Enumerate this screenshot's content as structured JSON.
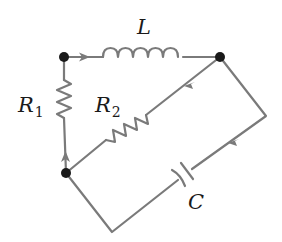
{
  "diagram": {
    "type": "circuit",
    "colors": {
      "wire": "#7a7a7a",
      "node": "#1a1a1a",
      "label": "#1a1a1a",
      "background": "#ffffff"
    },
    "nodes": [
      {
        "id": "top-left",
        "x": 64,
        "y": 57
      },
      {
        "id": "top-right",
        "x": 220,
        "y": 57
      },
      {
        "id": "bottom-left",
        "x": 66,
        "y": 173
      }
    ],
    "components": [
      {
        "id": "L",
        "kind": "inductor",
        "label": "L",
        "between": [
          "top-left",
          "top-right"
        ]
      },
      {
        "id": "R1",
        "kind": "resistor",
        "label": "R",
        "subscript": "1",
        "between": [
          "top-left",
          "bottom-left"
        ]
      },
      {
        "id": "R2",
        "kind": "resistor",
        "label": "R",
        "subscript": "2",
        "between": [
          "top-right",
          "bottom-left"
        ]
      },
      {
        "id": "C",
        "kind": "capacitor",
        "label": "C",
        "between": [
          "top-right",
          "bottom-left"
        ]
      }
    ],
    "current_arrows": [
      {
        "location": "top wire",
        "direction": "right"
      },
      {
        "location": "R2 branch",
        "direction": "down-left"
      },
      {
        "location": "capacitor branch",
        "direction": "down-left"
      },
      {
        "location": "R1 branch",
        "direction": "up"
      }
    ]
  },
  "labels": {
    "inductor": "L",
    "r1_main": "R",
    "r1_sub": "1",
    "r2_main": "R",
    "r2_sub": "2",
    "capacitor": "C"
  }
}
